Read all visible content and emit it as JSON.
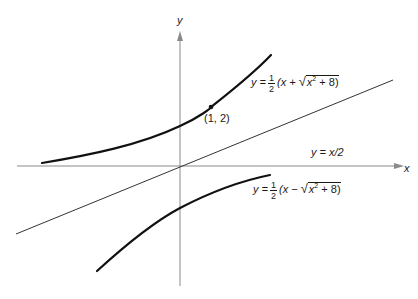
{
  "figure": {
    "axes": {
      "x_label": "x",
      "y_label": "y"
    },
    "point": {
      "label": "(1, 2)",
      "x": 1,
      "y": 2
    },
    "curves": [
      {
        "id": "upper-branch",
        "label_prefix": "y =",
        "frac_num": "1",
        "frac_den": "2",
        "open": "(x +",
        "radical": "√",
        "radicand_base": "x",
        "radicand_exp": "2",
        "radicand_rest": "+ 8)",
        "formula": "y = 1/2 (x + √(x² + 8))"
      },
      {
        "id": "lower-branch",
        "label_prefix": "y =",
        "frac_num": "1",
        "frac_den": "2",
        "open": "(x −",
        "radical": "√",
        "radicand_base": "x",
        "radicand_exp": "2",
        "radicand_rest": "+ 8)",
        "formula": "y = 1/2 (x − √(x² + 8))"
      },
      {
        "id": "asymptote",
        "label": "y = x/2",
        "formula": "y = x/2"
      }
    ],
    "colors": {
      "curve": "#111111",
      "axis": "#8a8a8a",
      "asymptote": "#333333",
      "text": "#1a1a1a"
    }
  }
}
